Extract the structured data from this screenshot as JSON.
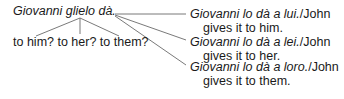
{
  "source": {
    "sentence": "Giovanni glielo dà.",
    "question": "to him? to her? to them?"
  },
  "options": [
    {
      "italian": "Giovanni lo dà a lui.",
      "sep": "/",
      "english_1": "John",
      "english_2": "gives it to him."
    },
    {
      "italian": "Giovanni lo dà a lei.",
      "sep": "/",
      "english_1": "John",
      "english_2": "gives it to her."
    },
    {
      "italian": "Giovanni lo dà a loro.",
      "sep": "/",
      "english_1": "John",
      "english_2": "gives it to them."
    }
  ],
  "colors": {
    "text": "#1a1a1a",
    "line": "#6a6a6a"
  }
}
